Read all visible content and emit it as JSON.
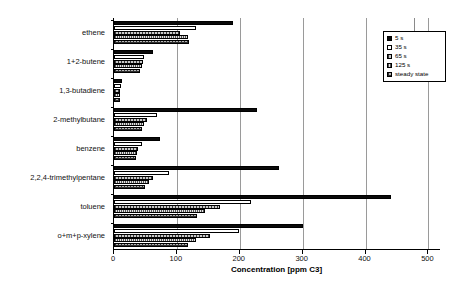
{
  "chart": {
    "type": "bar",
    "orientation": "horizontal",
    "xlabel": "Concentration [ppm C3]",
    "ylabel": "",
    "title": "",
    "xlim": [
      0,
      520
    ],
    "xticks": [
      0,
      100,
      200,
      300,
      400,
      500
    ],
    "xtick_labels": [
      "0",
      "100",
      "200",
      "300",
      "400",
      "500"
    ],
    "gridlines": [
      100,
      200,
      300,
      400,
      500
    ],
    "grid": true,
    "legend_position": "top-right"
  },
  "chart_data": {
    "type": "bar",
    "title": "",
    "xlabel": "Concentration [ppm C3]",
    "ylabel": "",
    "xlim": [
      0,
      520
    ],
    "grid": true,
    "legend_position": "top-right",
    "categories": [
      "ethene",
      "1+2-butene",
      "1,3-butadiene",
      "2-methylbutane",
      "benzene",
      "2,2,4-trimethylpentane",
      "toluene",
      "o+m+p-xylene"
    ],
    "series": [
      {
        "name": "5 s",
        "values": [
          189,
          62,
          13,
          228,
          73,
          262,
          440,
          300
        ]
      },
      {
        "name": "35 s",
        "values": [
          130,
          48,
          11,
          68,
          44,
          87,
          218,
          198
        ]
      },
      {
        "name": "65 s",
        "values": [
          105,
          46,
          10,
          52,
          38,
          62,
          168,
          152
        ]
      },
      {
        "name": "125 s",
        "values": [
          118,
          44,
          10,
          48,
          36,
          55,
          145,
          130
        ]
      },
      {
        "name": "steady state",
        "values": [
          120,
          42,
          9,
          45,
          35,
          50,
          132,
          118
        ]
      }
    ]
  },
  "legend": {
    "items": [
      {
        "label": "5 s",
        "swatch": "solid-black"
      },
      {
        "label": "35 s",
        "swatch": "solid-white"
      },
      {
        "label": "65 s",
        "swatch": "vertical-hatch-gray"
      },
      {
        "label": "125 s",
        "swatch": "fine-vertical-hatch-light"
      },
      {
        "label": "steady state",
        "swatch": "cross-hatch-gray"
      }
    ]
  },
  "colors": {
    "axis": "#000000",
    "grid": "#9a9a9a",
    "series_5s": "#0a0a0a",
    "series_35s": "#ffffff",
    "series_65s": "#c9c9c9",
    "series_125s": "#e3e3e3",
    "series_steady": "#b4b4b4",
    "text": "#111111",
    "background": "#ffffff"
  }
}
